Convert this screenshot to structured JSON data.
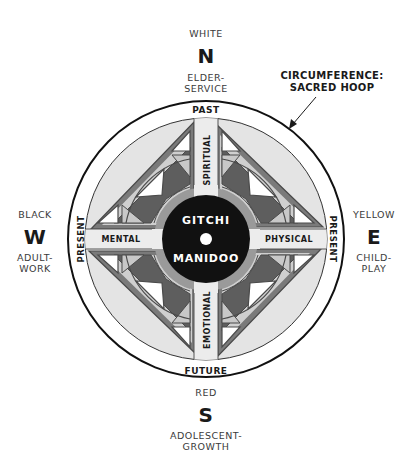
{
  "diagram": {
    "center": {
      "line1": "GITCHI",
      "line2": "MANIDOO"
    },
    "bands": {
      "north": "SPIRITUAL",
      "east": "PHYSICAL",
      "south": "EMOTIONAL",
      "west": "MENTAL"
    },
    "hoop": {
      "top": "PAST",
      "bottom": "FUTURE",
      "left": "PRESENT",
      "right": "PRESENT"
    },
    "annotation": {
      "line1": "CIRCUMFERENCE:",
      "line2": "SACRED HOOP"
    },
    "directions": {
      "north": {
        "color_name": "WHITE",
        "letter": "N",
        "stage_line1": "ELDER-",
        "stage_line2": "SERVICE"
      },
      "east": {
        "color_name": "YELLOW",
        "letter": "E",
        "stage_line1": "CHILD-",
        "stage_line2": "PLAY"
      },
      "south": {
        "color_name": "RED",
        "letter": "S",
        "stage_line1": "ADOLESCENT-",
        "stage_line2": "GROWTH"
      },
      "west": {
        "color_name": "BLACK",
        "letter": "W",
        "stage_line1": "ADULT-",
        "stage_line2": "WORK"
      }
    },
    "colors": {
      "ink": "#1a1a1a",
      "outline": "#555555",
      "light_gray": "#e4e4e4",
      "band": "#ececec",
      "mid_gray": "#9a9a9a",
      "dark_gray": "#5e5e5e",
      "pale_tri": "#c8c8c8",
      "white": "#ffffff"
    }
  }
}
